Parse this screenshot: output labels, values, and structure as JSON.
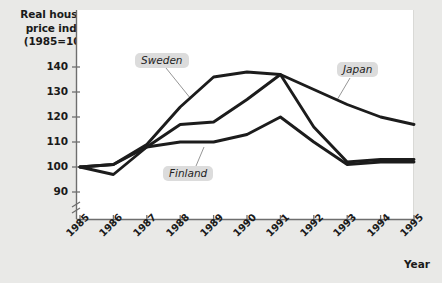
{
  "chart_data": {
    "type": "line",
    "title": "Real housing price index (1985=100)",
    "ylabel": "Real housing\nprice index\n(1985=100)",
    "xlabel": "Year",
    "categories": [
      "1985",
      "1986",
      "1987",
      "1988",
      "1989",
      "1990",
      "1991",
      "1992",
      "1993",
      "1994",
      "1995"
    ],
    "x": [
      1985,
      1986,
      1987,
      1988,
      1989,
      1990,
      1991,
      1992,
      1993,
      1994,
      1995
    ],
    "yticks": [
      90,
      100,
      110,
      120,
      130,
      140
    ],
    "ylim": [
      86,
      145
    ],
    "axis_break": true,
    "grid": false,
    "legend_position": "inline-callout",
    "series": [
      {
        "name": "Sweden",
        "color": "#1c1c1c",
        "values": [
          100,
          101,
          109,
          124,
          136,
          138,
          137,
          116,
          102,
          103,
          103
        ]
      },
      {
        "name": "Finland",
        "color": "#1c1c1c",
        "values": [
          100,
          101,
          108,
          110,
          110,
          113,
          120,
          110,
          101,
          102,
          102
        ]
      },
      {
        "name": "Japan",
        "color": "#1c1c1c",
        "values": [
          100,
          97,
          108,
          117,
          118,
          127,
          137,
          131,
          125,
          120,
          117
        ]
      }
    ]
  },
  "labels": {
    "sweden": "Sweden",
    "finland": "Finland",
    "japan": "Japan"
  }
}
